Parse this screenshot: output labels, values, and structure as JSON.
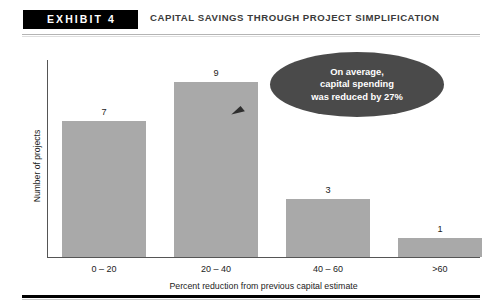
{
  "header": {
    "badge_label": "EXHIBIT 4",
    "title": "CAPITAL SAVINGS THROUGH PROJECT SIMPLIFICATION"
  },
  "callout": {
    "line1": "On average,",
    "line2": "capital spending",
    "line3": "was reduced by 27%"
  },
  "chart_data": {
    "type": "bar",
    "title": "Capital Savings through Project Simplification",
    "categories": [
      "0 – 20",
      "20 – 40",
      "40 – 60",
      ">60"
    ],
    "values": [
      7,
      9,
      3,
      1
    ],
    "xlabel": "Percent reduction from previous capital estimate",
    "ylabel": "Number of projects",
    "ylim": [
      0,
      10
    ],
    "grid": false,
    "legend": "none",
    "bar_color": "#a9a9a9",
    "annotation": "On average, capital spending was reduced by 27%",
    "annotation_target_category": "20 – 40"
  },
  "colors": {
    "bar": "#a9a9a9",
    "callout_fill": "#4a4a4a",
    "axis": "#555555",
    "text": "#1c1c1c",
    "badge_bg": "#000000"
  }
}
